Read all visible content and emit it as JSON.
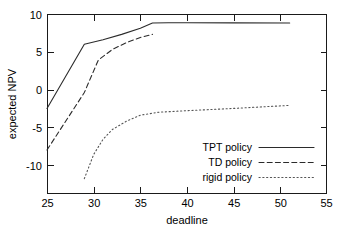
{
  "chart_data": {
    "type": "line",
    "title": "",
    "xlabel": "deadline",
    "ylabel": "expected NPV",
    "xlim": [
      25,
      55
    ],
    "ylim": [
      -13.7,
      10
    ],
    "xticks": [
      25,
      30,
      35,
      40,
      45,
      50,
      55
    ],
    "xtick_labels": [
      "25",
      "30",
      "35",
      "40",
      "45",
      "50",
      "55"
    ],
    "yticks": [
      10,
      5,
      0,
      -5,
      -10
    ],
    "ytick_labels": [
      "10",
      "5",
      "0",
      "-5",
      "-10"
    ],
    "grid": false,
    "legend_position": "lower right inside axes",
    "series": [
      {
        "name": "TPT policy",
        "style": "solid",
        "color": "#2b2b2b",
        "x": [
          25,
          29,
          31,
          33,
          35,
          36.3,
          38,
          40,
          45,
          51
        ],
        "y": [
          -2.5,
          6.0,
          6.6,
          7.3,
          8.1,
          8.8,
          8.85,
          8.85,
          8.82,
          8.8
        ]
      },
      {
        "name": "TD policy",
        "style": "dashed",
        "color": "#2b2b2b",
        "x": [
          25,
          27,
          29,
          30.5,
          32,
          33.5,
          35,
          36.3
        ],
        "y": [
          -8.0,
          -4.2,
          -0.4,
          3.9,
          5.3,
          6.2,
          6.9,
          7.3
        ]
      },
      {
        "name": "rigid policy",
        "style": "dotted",
        "color": "#555555",
        "x": [
          29,
          30,
          31,
          32,
          33.5,
          35,
          37,
          40,
          45,
          48,
          51
        ],
        "y": [
          -11.8,
          -8.6,
          -6.6,
          -5.3,
          -4.2,
          -3.4,
          -3.0,
          -2.8,
          -2.5,
          -2.3,
          -2.1
        ]
      }
    ],
    "legend_entries": [
      {
        "label": "TPT policy",
        "style": "solid"
      },
      {
        "label": "TD policy",
        "style": "dashed"
      },
      {
        "label": "rigid policy",
        "style": "dotted"
      }
    ]
  },
  "axes_geometry": {
    "left_px": 47,
    "right_px": 327,
    "top_px": 14,
    "bottom_px": 193
  }
}
